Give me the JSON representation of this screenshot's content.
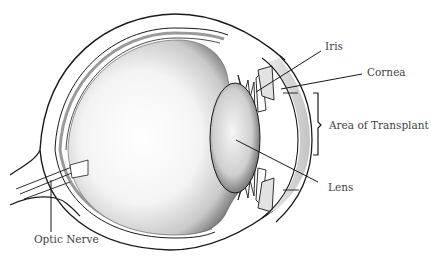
{
  "diagram": {
    "type": "anatomical-cross-section",
    "colors": {
      "ink": "#1a1a1a",
      "label_text": "#444444",
      "background": "#ffffff",
      "stipple_light": "#e6e6e6",
      "stipple_dark": "#8a8a8a"
    }
  },
  "labels": {
    "iris": "Iris",
    "cornea": "Cornea",
    "area_of_transplant": "Area of Transplant",
    "lens": "Lens",
    "optic_nerve": "Optic Nerve"
  }
}
